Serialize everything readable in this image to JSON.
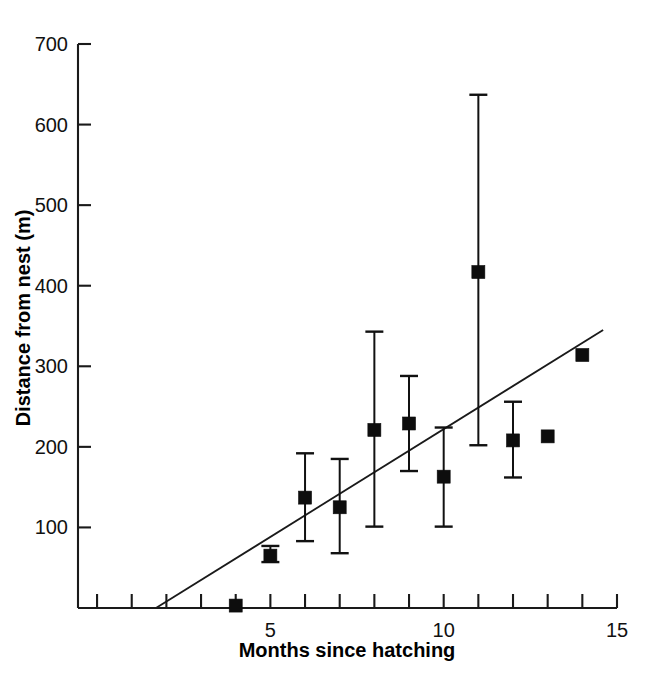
{
  "chart_data": {
    "type": "scatter",
    "title": "",
    "subtitle": "",
    "xlabel": "Months since hatching",
    "ylabel": "Distance from nest (m)",
    "xlim": [
      -0.55,
      15.0
    ],
    "ylim": [
      0,
      700
    ],
    "grid": false,
    "legend": "none",
    "x_ticks_major": [
      5,
      10,
      15
    ],
    "x_tick_labels": [
      "5",
      "10",
      "15"
    ],
    "x_ticks_minor": [
      0,
      1,
      2,
      3,
      4,
      6,
      7,
      8,
      9,
      11,
      12,
      13,
      14
    ],
    "y_ticks": [
      100,
      200,
      300,
      400,
      500,
      600,
      700
    ],
    "y_tick_labels": [
      "100",
      "200",
      "300",
      "400",
      "500",
      "600",
      "700"
    ],
    "x": [
      4,
      5,
      6,
      7,
      8,
      9,
      10,
      11,
      12,
      13,
      14
    ],
    "values": [
      3,
      65,
      137,
      125,
      221,
      229,
      163,
      417,
      208,
      213,
      314
    ],
    "error_low": [
      null,
      57,
      83,
      68,
      101,
      170,
      101,
      202,
      162,
      null,
      null
    ],
    "error_high": [
      null,
      77,
      192,
      185,
      343,
      288,
      224,
      637,
      256,
      null,
      null
    ],
    "points": [
      {
        "x": 4,
        "y": 3,
        "err_low": null,
        "err_high": null,
        "marker": "filled-square"
      },
      {
        "x": 5,
        "y": 65,
        "err_low": 57,
        "err_high": 77,
        "marker": "filled-square"
      },
      {
        "x": 6,
        "y": 137,
        "err_low": 83,
        "err_high": 192,
        "marker": "filled-square"
      },
      {
        "x": 7,
        "y": 125,
        "err_low": 68,
        "err_high": 185,
        "marker": "filled-square"
      },
      {
        "x": 8,
        "y": 221,
        "err_low": 101,
        "err_high": 343,
        "marker": "filled-square"
      },
      {
        "x": 9,
        "y": 229,
        "err_low": 170,
        "err_high": 288,
        "marker": "filled-square"
      },
      {
        "x": 10,
        "y": 163,
        "err_low": 101,
        "err_high": 224,
        "marker": "filled-square"
      },
      {
        "x": 11,
        "y": 417,
        "err_low": 202,
        "err_high": 637,
        "marker": "filled-square"
      },
      {
        "x": 12,
        "y": 208,
        "err_low": 162,
        "err_high": 256,
        "marker": "filled-square"
      },
      {
        "x": 13,
        "y": 213,
        "err_low": null,
        "err_high": null,
        "marker": "filled-square"
      },
      {
        "x": 14,
        "y": 314,
        "err_low": null,
        "err_high": null,
        "marker": "filled-square"
      }
    ],
    "series": [
      {
        "name": "mean distance from nest",
        "marker": "filled-square",
        "color": "#0d0d0d",
        "values": [
          3,
          65,
          137,
          125,
          221,
          229,
          163,
          417,
          208,
          213,
          314
        ]
      }
    ],
    "trend_line": {
      "type": "linear-regression",
      "x_start": 1.7,
      "y_start": 0,
      "x_end": 14.6,
      "y_end": 345,
      "color": "#1a1a1a"
    },
    "colors": {
      "marker": "#0d0d0d",
      "axis": "#1a1a1a",
      "background": "#ffffff",
      "text": "#111111"
    }
  }
}
